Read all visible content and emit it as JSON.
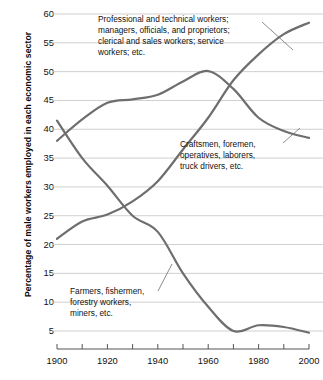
{
  "chart_data": {
    "type": "line",
    "title": "",
    "subtitle": "",
    "xlabel": "",
    "ylabel": "Percentage of male workers employed in each economic sector",
    "xlim": [
      1900,
      2000
    ],
    "ylim": [
      3,
      60
    ],
    "grid": true,
    "grid_axis": "y",
    "legend": "annotations-inline",
    "line_color": "#6e6e6e",
    "grid_color": "#c9c9c9",
    "axis_color": "#555555",
    "x_ticks": [
      1900,
      1910,
      1920,
      1930,
      1940,
      1950,
      1960,
      1970,
      1980,
      1990,
      2000
    ],
    "x_tick_labels": [
      "1900",
      "",
      "1920",
      "",
      "1940",
      "",
      "1960",
      "",
      "1980",
      "",
      "2000"
    ],
    "y_ticks": [
      5,
      10,
      15,
      20,
      25,
      30,
      35,
      40,
      45,
      50,
      55,
      60
    ],
    "y_tick_labels": [
      "5",
      "10",
      "15",
      "20",
      "25",
      "30",
      "35",
      "40",
      "45",
      "50",
      "55",
      "60"
    ],
    "x": [
      1900,
      1910,
      1920,
      1930,
      1940,
      1950,
      1960,
      1970,
      1980,
      1990,
      2000
    ],
    "series": [
      {
        "name": "Professional and technical workers; managers, officials, and proprietors; clerical and sales workers; service workers; etc.",
        "short_name": "professional",
        "values": [
          21.0,
          24.0,
          25.2,
          27.5,
          31.0,
          36.5,
          42.0,
          48.5,
          53.0,
          56.5,
          58.5
        ]
      },
      {
        "name": "Craftsmen, foremen, operatives, laborers, truck drivers, etc.",
        "short_name": "craftsmen",
        "values": [
          38.0,
          41.7,
          44.6,
          45.2,
          46.0,
          48.3,
          50.1,
          47.0,
          42.0,
          39.7,
          38.5
        ]
      },
      {
        "name": "Farmers, fishermen, forestry workers, miners, etc.",
        "short_name": "farmers",
        "values": [
          41.5,
          35.0,
          30.2,
          25.0,
          22.2,
          15.0,
          9.2,
          5.0,
          6.0,
          5.7,
          4.7
        ]
      }
    ],
    "annotations": [
      {
        "id": "professional-annotation",
        "text": "Professional and technical workers;\nmanagers, officials, and proprietors;\nclerical and sales workers; service\nworkers; etc.",
        "anchor_year": 1982,
        "anchor_value": 55.2
      },
      {
        "id": "craftsmen-annotation",
        "text": "Craftsmen, foremen,\noperatives, laborers,\ntruck drivers, etc.",
        "anchor_year": 1985,
        "anchor_value": 40.5
      },
      {
        "id": "farmers-annotation",
        "text": "Farmers, fishermen,\nforestry workers,\nminers, etc.",
        "anchor_year": 1948,
        "anchor_value": 14.0
      }
    ]
  }
}
